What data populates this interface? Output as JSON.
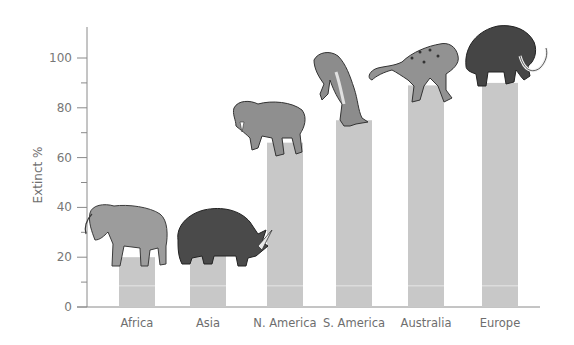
{
  "chart_data": {
    "type": "bar",
    "title": "",
    "xlabel": "",
    "ylabel": "Extinct %",
    "ylim": [
      0,
      110
    ],
    "yticks_major": [
      0,
      20,
      40,
      60,
      80,
      100
    ],
    "yticks_minor": [
      10,
      30,
      50,
      70,
      90
    ],
    "grid": false,
    "legend": null,
    "categories": [
      "Africa",
      "Asia",
      "N. America",
      "S. America",
      "Australia",
      "Europe"
    ],
    "values": [
      20,
      21,
      66,
      75,
      89,
      90
    ],
    "annotations": [
      {
        "category": "Africa",
        "illustration": "deinotherium"
      },
      {
        "category": "Asia",
        "illustration": "woolly-rhinoceros"
      },
      {
        "category": "N. America",
        "illustration": "saber-toothed-cat"
      },
      {
        "category": "S. America",
        "illustration": "giant-ground-sloth"
      },
      {
        "category": "Australia",
        "illustration": "marsupial-lion"
      },
      {
        "category": "Europe",
        "illustration": "woolly-mammoth"
      }
    ]
  },
  "colors": {
    "bar": "#c8c8c8",
    "axis": "#8a8a8a",
    "bar_stripe": "#e6e6e6"
  }
}
